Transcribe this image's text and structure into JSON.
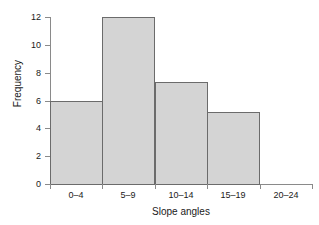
{
  "chart_data": {
    "type": "bar",
    "title": "",
    "subtitle": "",
    "xlabel": "Slope angles",
    "ylabel": "Frequency",
    "categories": [
      "0–4",
      "5–9",
      "10–14",
      "15–19",
      "20–24"
    ],
    "values": [
      6,
      12,
      7.3,
      5.2,
      0
    ],
    "ylim": [
      0,
      12
    ],
    "ytick_labels": [
      "0",
      "2",
      "4",
      "6",
      "8",
      "10",
      "12"
    ],
    "ytick_values": [
      0,
      2,
      4,
      6,
      8,
      10,
      12
    ],
    "grid": false,
    "legend": null,
    "annotations": [],
    "style": {
      "bar_fill": "#d4d4d4",
      "bar_edge": "#6b6b6b",
      "axis_color": "#8a8a8a",
      "text_color": "#1a1a1a",
      "background": "#ffffff"
    }
  }
}
